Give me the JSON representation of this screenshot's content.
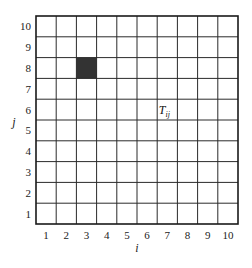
{
  "diagram": {
    "type": "grid",
    "columns": 10,
    "rows": 10,
    "x_axis": {
      "label": "i",
      "ticks": [
        "1",
        "2",
        "3",
        "4",
        "5",
        "6",
        "7",
        "8",
        "9",
        "10"
      ]
    },
    "y_axis": {
      "label": "j",
      "ticks": [
        "1",
        "2",
        "3",
        "4",
        "5",
        "6",
        "7",
        "8",
        "9",
        "10"
      ]
    },
    "highlighted_cells": [
      {
        "i": 3,
        "j": 8,
        "color": "#333333"
      }
    ],
    "cell_labels": [
      {
        "i": 7,
        "j": 6,
        "text": "T",
        "subscript": "ij"
      }
    ],
    "colors": {
      "grid": "#2a2a2a",
      "border": "#1a1a1a",
      "text": "#222222",
      "background": "#ffffff"
    }
  }
}
